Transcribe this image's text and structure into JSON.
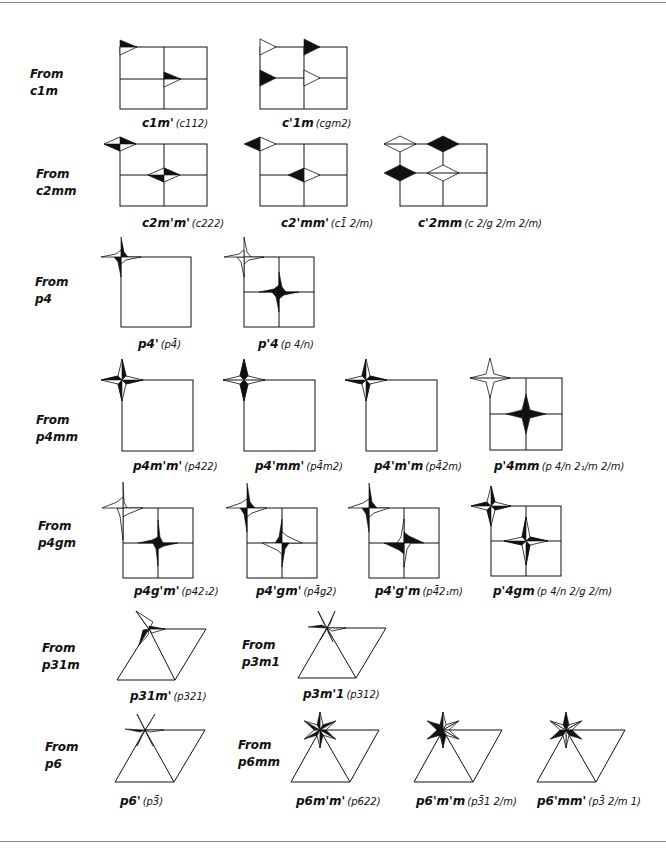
{
  "page": {
    "ink_color": "#111111",
    "background_color": "#ffffff",
    "rows": [
      {
        "from_label": [
          "From",
          "c1m"
        ],
        "figures": [
          {
            "symbol": "c1m'",
            "alt": "(c112)",
            "lattice": "rectangular-centered",
            "motif": "half-black triangle flags"
          },
          {
            "symbol": "c'1m",
            "alt": "(cgm2)",
            "lattice": "rectangular-centered",
            "motif": "black and white triangle flags"
          }
        ]
      },
      {
        "from_label": [
          "From",
          "c2mm"
        ],
        "figures": [
          {
            "symbol": "c2m'm'",
            "alt": "(c222)",
            "lattice": "rectangular-centered",
            "motif": "quartered diamonds"
          },
          {
            "symbol": "c2'mm'",
            "alt": "(c1̄ 2/m)",
            "lattice": "rectangular-centered",
            "motif": "half-black diamonds"
          },
          {
            "symbol": "c'2mm",
            "alt": "(c 2/g 2/m 2/m)",
            "lattice": "rectangular-centered",
            "motif": "black and white diamonds"
          }
        ]
      },
      {
        "from_label": [
          "From",
          "p4"
        ],
        "figures": [
          {
            "symbol": "p4'",
            "alt": "(p4̄)",
            "lattice": "square",
            "motif": "pinwheel"
          },
          {
            "symbol": "p'4",
            "alt": "(p 4/n)",
            "lattice": "square-centered",
            "motif": "white and black pinwheels"
          }
        ]
      },
      {
        "from_label": [
          "From",
          "p4mm"
        ],
        "figures": [
          {
            "symbol": "p4m'm'",
            "alt": "(p422)",
            "lattice": "square",
            "motif": "four-point star, alternating halves"
          },
          {
            "symbol": "p4'mm'",
            "alt": "(p4̄m2)",
            "lattice": "square",
            "motif": "four-point star"
          },
          {
            "symbol": "p4'm'm",
            "alt": "(p4̄2m)",
            "lattice": "square",
            "motif": "four-point star"
          },
          {
            "symbol": "p'4mm",
            "alt": "(p 4/n 2₁/m 2/m)",
            "lattice": "square-centered",
            "motif": "white and black stars"
          }
        ]
      },
      {
        "from_label": [
          "From",
          "p4gm"
        ],
        "figures": [
          {
            "symbol": "p4g'm'",
            "alt": "(p42₁2)",
            "lattice": "square-centered",
            "motif": "pinwheels"
          },
          {
            "symbol": "p4'gm'",
            "alt": "(p4̄g2)",
            "lattice": "square-centered",
            "motif": "pinwheels"
          },
          {
            "symbol": "p4'g'm",
            "alt": "(p4̄2₁m)",
            "lattice": "square-centered",
            "motif": "pinwheels"
          },
          {
            "symbol": "p'4gm",
            "alt": "(p 4/n 2/g 2/m)",
            "lattice": "square-centered",
            "motif": "stars"
          }
        ]
      },
      {
        "from_label": [
          "From",
          "p31m"
        ],
        "figures": [
          {
            "symbol": "p31m'",
            "alt": "(p321)",
            "lattice": "hexagonal",
            "motif": "three-point star"
          }
        ]
      },
      {
        "from_label": [
          "From",
          "p3m1"
        ],
        "figures": [
          {
            "symbol": "p3m'1",
            "alt": "(p312)",
            "lattice": "hexagonal",
            "motif": "three-point star"
          }
        ]
      },
      {
        "from_label": [
          "From",
          "p6"
        ],
        "figures": [
          {
            "symbol": "p6'",
            "alt": "(p3̄)",
            "lattice": "hexagonal",
            "motif": "six-point pinwheel"
          }
        ]
      },
      {
        "from_label": [
          "From",
          "p6mm"
        ],
        "figures": [
          {
            "symbol": "p6m'm'",
            "alt": "(p622)",
            "lattice": "hexagonal",
            "motif": "six-point star"
          },
          {
            "symbol": "p6'm'm",
            "alt": "(p3̄1 2/m)",
            "lattice": "hexagonal",
            "motif": "six-point star"
          },
          {
            "symbol": "p6'mm'",
            "alt": "(p3̄ 2/m 1)",
            "lattice": "hexagonal",
            "motif": "six-point star"
          }
        ]
      }
    ]
  }
}
